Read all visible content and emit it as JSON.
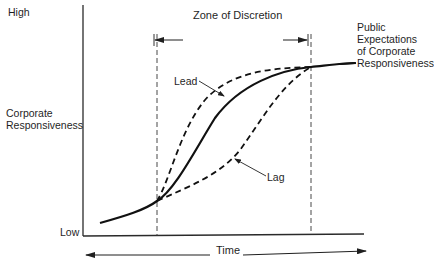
{
  "diagram": {
    "y_axis": {
      "high_label": "High",
      "low_label": "Low",
      "title_line1": "Corporate",
      "title_line2": "Responsiveness"
    },
    "x_axis": {
      "title": "Time"
    },
    "zone": {
      "label": "Zone of Discretion"
    },
    "curves": {
      "public_expectations": {
        "line1": "Public",
        "line2": "Expectations",
        "line3": "of Corporate",
        "line4": "Responsiveness",
        "style": "solid"
      },
      "lead": {
        "label": "Lead",
        "style": "dashed"
      },
      "lag": {
        "label": "Lag",
        "style": "dashed"
      }
    },
    "colors": {
      "ink": "#1f1f1f",
      "background": "#ffffff"
    }
  }
}
